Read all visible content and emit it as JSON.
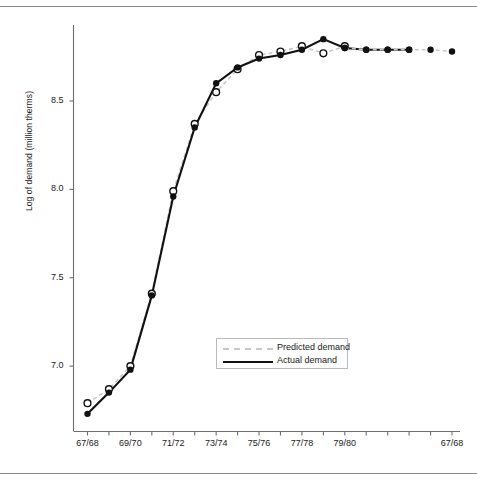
{
  "figure": {
    "ylabel": "Log of demand (million therms)",
    "xlabel": "",
    "title": ""
  },
  "legend": {
    "position": "inside-center-lower",
    "items": [
      {
        "label": "Predicted demand",
        "style": "dashed",
        "color": "#c8c8c8",
        "marker": "open-circle"
      },
      {
        "label": "Actual demand",
        "style": "solid",
        "color": "#111111",
        "marker": "filled-circle"
      }
    ]
  },
  "axes": {
    "y_ticks": [
      "7.0",
      "7.5",
      "8.0",
      "8.5"
    ],
    "y_tick_values": [
      7.0,
      7.5,
      8.0,
      8.5
    ],
    "x_ticks_labeled": [
      "67/68",
      "69/70",
      "71/72",
      "73/74",
      "75/76",
      "77/78",
      "79/80",
      "67/68"
    ]
  },
  "chart_data": {
    "type": "line",
    "title": "",
    "xlabel": "",
    "ylabel": "Log of demand (million therms)",
    "ylim": [
      6.63,
      8.93
    ],
    "xlim": [
      0,
      18
    ],
    "grid": false,
    "legend_position": "inside lower center",
    "x_tick_labels": [
      "67/68",
      "",
      "69/70",
      "",
      "71/72",
      "",
      "73/74",
      "",
      "75/76",
      "",
      "77/78",
      "",
      "79/80",
      "",
      "",
      "",
      "",
      "67/68"
    ],
    "x_tick_labels_shown": [
      "67/68",
      "69/70",
      "71/72",
      "73/74",
      "75/76",
      "77/78",
      "79/80",
      "67/68"
    ],
    "x_indices": [
      0,
      1,
      2,
      3,
      4,
      5,
      6,
      7,
      8,
      9,
      10,
      11,
      12,
      13,
      14,
      15,
      16,
      17
    ],
    "series": [
      {
        "name": "Predicted demand",
        "style": "dashed",
        "color": "#c8c8c8",
        "marker": "open-circle",
        "values": [
          6.79,
          6.87,
          7.0,
          7.41,
          7.99,
          8.37,
          8.55,
          8.68,
          8.76,
          8.78,
          8.81,
          8.77,
          8.81,
          null,
          null,
          null,
          null,
          null
        ]
      },
      {
        "name": "Actual demand",
        "style": "solid",
        "color": "#111111",
        "marker": "filled-circle",
        "values": [
          6.73,
          6.85,
          6.98,
          7.4,
          7.96,
          8.35,
          8.6,
          8.69,
          8.74,
          8.76,
          8.79,
          8.85,
          8.8,
          8.79,
          8.79,
          8.79,
          null,
          null
        ]
      },
      {
        "name": "Predicted demand (extrapolated)",
        "style": "dashed",
        "color": "#c8c8c8",
        "marker": "filled-circle",
        "values": [
          null,
          null,
          null,
          null,
          null,
          null,
          null,
          null,
          null,
          null,
          null,
          null,
          8.8,
          8.79,
          8.79,
          8.79,
          8.79,
          8.78
        ]
      }
    ]
  }
}
